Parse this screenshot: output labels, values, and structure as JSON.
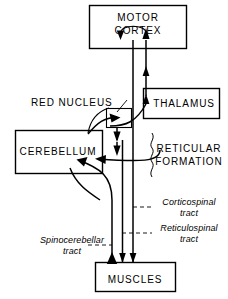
{
  "diagram": {
    "background_color": "#ffffff",
    "line_color": "#000000",
    "nodes": [
      {
        "id": "motor_cortex",
        "label_line1": "MOTOR",
        "label_line2": "CORTEX",
        "style": "box"
      },
      {
        "id": "thalamus",
        "label": "THALAMUS",
        "style": "box"
      },
      {
        "id": "cerebellum",
        "label": "CEREBELLUM",
        "style": "box"
      },
      {
        "id": "red_nucleus",
        "label": "RED  NUCLEUS",
        "style": "small-box-with-leader"
      },
      {
        "id": "reticular_formation",
        "label_line1": "RETICULAR",
        "label_line2": "FORMATION",
        "style": "text-with-brace"
      },
      {
        "id": "muscles",
        "label": "MUSCLES",
        "style": "box"
      }
    ],
    "tract_labels": [
      {
        "id": "corticospinal",
        "line1": "Corticospinal",
        "line2": "tract"
      },
      {
        "id": "reticulospinal",
        "line1": "Reticulospinal",
        "line2": "tract"
      },
      {
        "id": "spinocerebellar",
        "line1": "Spinocerebellar",
        "line2": "tract"
      }
    ]
  }
}
